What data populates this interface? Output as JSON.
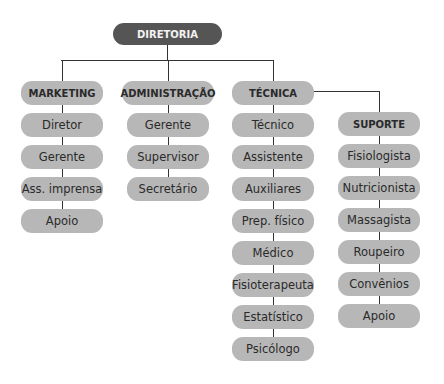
{
  "root": {
    "label": "DIRETORIA"
  },
  "columns": [
    {
      "head": "MARKETING",
      "items": [
        "Diretor",
        "Gerente",
        "Ass. imprensa",
        "Apoio"
      ]
    },
    {
      "head": "ADMINISTRAÇÃO",
      "items": [
        "Gerente",
        "Supervisor",
        "Secretário"
      ]
    },
    {
      "head": "TÉCNICA",
      "items": [
        "Técnico",
        "Assistente",
        "Auxiliares",
        "Prep. físico",
        "Médico",
        "Fisioterapeuta",
        "Estatístico",
        "Psicólogo"
      ]
    },
    {
      "head": "SUPORTE",
      "items": [
        "Fisiologista",
        "Nutricionista",
        "Massagista",
        "Roupeiro",
        "Convênios",
        "Apoio"
      ]
    }
  ],
  "colors": {
    "root": "#555555",
    "box": "#b7b7b7",
    "line": "#333333"
  }
}
